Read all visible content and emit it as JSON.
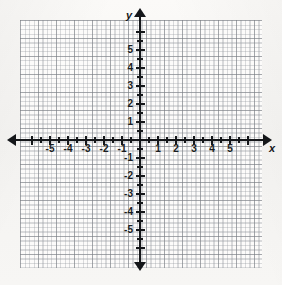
{
  "figure": {
    "kind": "cartesian-coordinate-plane",
    "background_color": "#f6f5f3",
    "grid_color": "#787c82",
    "axis_color": "#15171a"
  },
  "axes": {
    "x": {
      "name": "x",
      "min": -6,
      "max": 6,
      "tick_labels": [
        "-5",
        "-4",
        "-3",
        "-2",
        "-1",
        "1",
        "2",
        "3",
        "4",
        "5"
      ],
      "tick_values": [
        -5,
        -4,
        -3,
        -2,
        -1,
        1,
        2,
        3,
        4,
        5
      ],
      "arrow_both_ends": true
    },
    "y": {
      "name": "y",
      "min": -6,
      "max": 6,
      "tick_labels": [
        "5",
        "4",
        "3",
        "2",
        "1",
        "-1",
        "-2",
        "-3",
        "-4",
        "-5"
      ],
      "tick_values": [
        5,
        4,
        3,
        2,
        1,
        -1,
        -2,
        -3,
        -4,
        -5
      ],
      "arrow_both_ends": true
    }
  },
  "chart_data": {
    "type": "scatter",
    "title": "",
    "subtitle": "",
    "xlabel": "x",
    "ylabel": "y",
    "xlim": [
      -6,
      6
    ],
    "ylim": [
      -6,
      6
    ],
    "x_ticks": [
      -5,
      -4,
      -3,
      -2,
      -1,
      1,
      2,
      3,
      4,
      5
    ],
    "y_ticks": [
      5,
      4,
      3,
      2,
      1,
      -1,
      -2,
      -3,
      -4,
      -5
    ],
    "x_tick_labels": [
      "-5",
      "-4",
      "-3",
      "-2",
      "-1",
      "1",
      "2",
      "3",
      "4",
      "5"
    ],
    "y_tick_labels": [
      "5",
      "4",
      "3",
      "2",
      "1",
      "-1",
      "-2",
      "-3",
      "-4",
      "-5"
    ],
    "minor_tick_step": 0.5,
    "grid": true,
    "grid_minor": true,
    "grid_minor_step": 0.25,
    "legend": false,
    "legend_position": "none",
    "annotations": [],
    "series": [
      {
        "name": "",
        "x": [],
        "y": []
      }
    ]
  }
}
